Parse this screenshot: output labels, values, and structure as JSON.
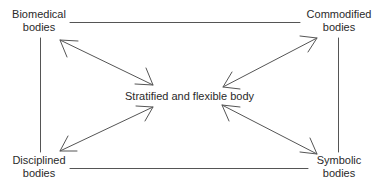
{
  "diagram": {
    "center": {
      "label": "Stratified and flexible body"
    },
    "corners": {
      "top_left": {
        "line1": "Biomedical",
        "line2": "bodies"
      },
      "top_right": {
        "line1": "Commodified",
        "line2": "bodies"
      },
      "bottom_left": {
        "line1": "Disciplined",
        "line2": "bodies"
      },
      "bottom_right": {
        "line1": "Symbolic",
        "line2": "bodies"
      }
    },
    "edges": [
      {
        "from": "Biomedical bodies",
        "to": "Commodified bodies",
        "type": "line"
      },
      {
        "from": "Biomedical bodies",
        "to": "Disciplined bodies",
        "type": "line"
      },
      {
        "from": "Commodified bodies",
        "to": "Symbolic bodies",
        "type": "line"
      },
      {
        "from": "Disciplined bodies",
        "to": "Symbolic bodies",
        "type": "line"
      },
      {
        "from": "Stratified and flexible body",
        "to": "Biomedical bodies",
        "type": "double-arrow"
      },
      {
        "from": "Stratified and flexible body",
        "to": "Commodified bodies",
        "type": "double-arrow"
      },
      {
        "from": "Stratified and flexible body",
        "to": "Disciplined bodies",
        "type": "double-arrow"
      },
      {
        "from": "Stratified and flexible body",
        "to": "Symbolic bodies",
        "type": "double-arrow"
      }
    ],
    "colors": {
      "line": "#555555",
      "text": "#2a2a2a",
      "background": "#ffffff"
    }
  }
}
